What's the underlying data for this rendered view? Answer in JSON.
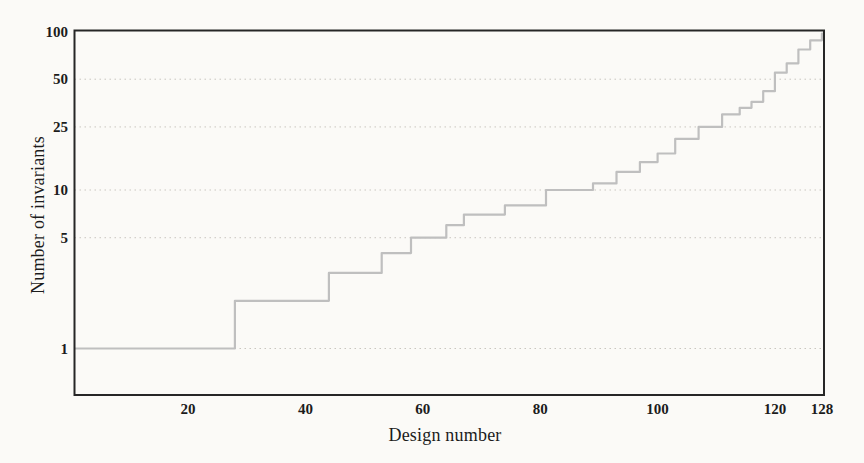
{
  "chart_data": {
    "type": "line",
    "subtype": "step-after",
    "title": "",
    "xlabel": "Design number",
    "ylabel": "Number of invariants",
    "x_domain": [
      0,
      128
    ],
    "x_ticks": [
      20,
      40,
      60,
      80,
      100,
      120,
      128
    ],
    "y_scale": "log",
    "y_ticks": [
      1,
      5,
      10,
      25,
      50,
      100
    ],
    "y_top": 100,
    "grid": "horizontal-dotted-at-yticks",
    "legend": "none",
    "series_name": "invariants-per-design",
    "segments": [
      {
        "value": 1,
        "count": 27
      },
      {
        "value": 2,
        "count": 16
      },
      {
        "value": 3,
        "count": 9
      },
      {
        "value": 4,
        "count": 5
      },
      {
        "value": 5,
        "count": 6
      },
      {
        "value": 6,
        "count": 3
      },
      {
        "value": 7,
        "count": 7
      },
      {
        "value": 8,
        "count": 7
      },
      {
        "value": 10,
        "count": 8
      },
      {
        "value": 11,
        "count": 4
      },
      {
        "value": 13,
        "count": 4
      },
      {
        "value": 15,
        "count": 3
      },
      {
        "value": 17,
        "count": 3
      },
      {
        "value": 21,
        "count": 4
      },
      {
        "value": 25,
        "count": 4
      },
      {
        "value": 30,
        "count": 3
      },
      {
        "value": 33,
        "count": 2
      },
      {
        "value": 36,
        "count": 2
      },
      {
        "value": 42,
        "count": 2
      },
      {
        "value": 55,
        "count": 2
      },
      {
        "value": 63,
        "count": 2
      },
      {
        "value": 77,
        "count": 2
      },
      {
        "value": 88,
        "count": 2
      },
      {
        "value": 97,
        "count": 1
      }
    ]
  },
  "colors": {
    "background": "#fbfaf7",
    "frame": "#262626",
    "grid": "#c9c6bf",
    "curve": "#bfbfbf",
    "text": "#1c1c1c"
  }
}
